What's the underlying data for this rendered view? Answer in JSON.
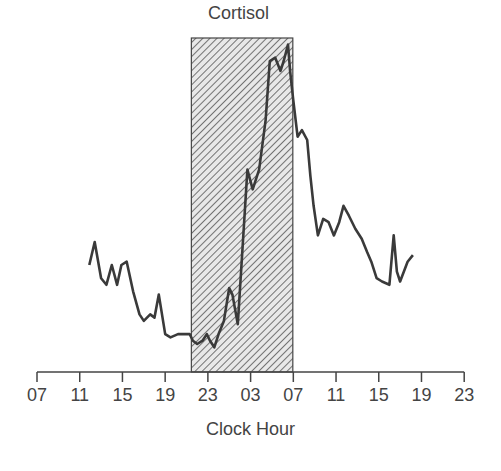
{
  "chart_data": {
    "type": "line",
    "title": "Cortisol",
    "xlabel": "Clock Hour",
    "ylabel": "",
    "x_tick_labels": [
      "07",
      "11",
      "15",
      "19",
      "23",
      "03",
      "07",
      "11",
      "15",
      "19",
      "23"
    ],
    "x_tick_hours_elapsed": [
      0,
      4,
      8,
      12,
      16,
      20,
      24,
      28,
      32,
      36,
      40
    ],
    "y_axis_shown": false,
    "grid": false,
    "legend": null,
    "shaded_region": {
      "description": "Hatched sleep period",
      "start_clock": "~21:30",
      "end_clock": "07:00",
      "start_hours_elapsed": 14.5,
      "end_hours_elapsed": 24,
      "pattern": "diagonal-hatch"
    },
    "series": [
      {
        "name": "Cortisol",
        "color": "#3a3a3a",
        "x_hours_elapsed": [
          4.9,
          5.4,
          6.0,
          6.5,
          7.0,
          7.5,
          7.9,
          8.4,
          9.0,
          9.6,
          10.0,
          10.6,
          11.0,
          11.4,
          12.0,
          12.5,
          13.2,
          13.7,
          14.3,
          14.6,
          15.0,
          15.5,
          15.9,
          16.2,
          16.6,
          17.0,
          17.5,
          18.0,
          18.3,
          18.8,
          19.2,
          19.7,
          20.2,
          20.8,
          21.4,
          21.8,
          22.3,
          22.8,
          23.1,
          23.5,
          23.7,
          24.0,
          24.4,
          24.8,
          25.3,
          25.6,
          25.9,
          26.3,
          26.8,
          27.3,
          27.8,
          28.3,
          28.7,
          29.2,
          29.8,
          30.4,
          30.9,
          31.3,
          31.8,
          32.3,
          33.0,
          33.4,
          33.7,
          34.0,
          34.7,
          35.2,
          35.8
        ],
        "values_relative": [
          31,
          38,
          27,
          25,
          31,
          25,
          31,
          32,
          23,
          16,
          14,
          16,
          15,
          22,
          10,
          9,
          10,
          10,
          10,
          8,
          7,
          8,
          10,
          8,
          6,
          10,
          14,
          24,
          22,
          13,
          34,
          60,
          54,
          60,
          75,
          93,
          94,
          90,
          93,
          98,
          90,
          81,
          70,
          72,
          69,
          58,
          49,
          40,
          45,
          44,
          40,
          44,
          49,
          46,
          42,
          39,
          35,
          32,
          27,
          26,
          25,
          40,
          29,
          26,
          32,
          34
        ],
        "values_note": "Relative units (0 = axis baseline, 100 = top of shaded region); no y-axis scale shown"
      }
    ]
  }
}
